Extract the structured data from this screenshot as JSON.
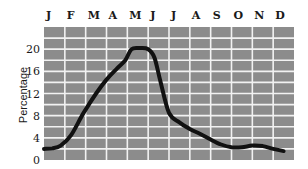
{
  "chart_data": {
    "type": "line",
    "title": "",
    "xlabel": "",
    "ylabel": "Percentage",
    "categories": [
      "J",
      "F",
      "M",
      "A",
      "M",
      "J",
      "J",
      "A",
      "S",
      "O",
      "N",
      "D"
    ],
    "yticks": [
      0,
      4,
      8,
      12,
      16,
      20
    ],
    "ylim": [
      0,
      24
    ],
    "grid": true,
    "legend": null,
    "x_axis_position": "top",
    "series": [
      {
        "name": "Percentage",
        "x": [
          0,
          0.4,
          0.8,
          1.3,
          1.9,
          2.5,
          3.0,
          3.5,
          3.9,
          4.2,
          4.6,
          5.0,
          5.3,
          5.6,
          6.0,
          6.5,
          7.0,
          7.5,
          8.0,
          8.5,
          9.0,
          9.5,
          10.0,
          10.5,
          11.0,
          11.5
        ],
        "values": [
          2,
          2.1,
          2.6,
          4.5,
          8.5,
          12,
          14.5,
          16.5,
          18,
          20,
          20.2,
          20,
          18.5,
          14,
          8.5,
          6.8,
          5.6,
          4.7,
          3.7,
          2.8,
          2.3,
          2.3,
          2.6,
          2.5,
          2.0,
          1.6
        ]
      }
    ]
  },
  "colors": {
    "grid_fill": "#8c8c8c",
    "grid_lines": "#f2f2f2",
    "line": "#111111",
    "background": "#ffffff"
  }
}
